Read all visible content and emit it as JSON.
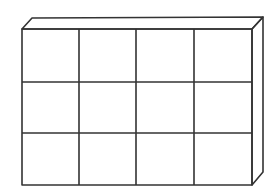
{
  "diagram": {
    "rows": 3,
    "columns": 4,
    "stroke_color": "#333333",
    "background": "#ffffff",
    "front_face": {
      "x": 22,
      "y": 29,
      "width": 230,
      "height": 156
    },
    "depth_offset": {
      "dx": 11,
      "dy": -11
    },
    "column_dividers_x": [
      79,
      136,
      194
    ],
    "row_dividers_y": [
      82,
      133
    ]
  }
}
